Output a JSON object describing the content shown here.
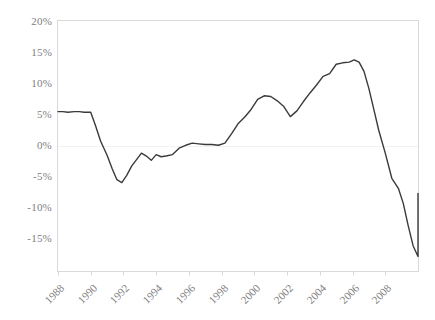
{
  "chart_data": {
    "type": "line",
    "title": "",
    "subtitle": "",
    "xlabel": "",
    "ylabel": "",
    "ylim": [
      -15,
      20
    ],
    "xlim": [
      1988,
      2010
    ],
    "grid": false,
    "legend": null,
    "y_ticks": [
      20,
      15,
      10,
      5,
      0,
      -5,
      -10,
      -15
    ],
    "y_tick_labels": [
      "20%",
      "15%",
      "10%",
      "5%",
      "0%",
      "-5%",
      "-10%",
      "-15%"
    ],
    "x_ticks": [
      1988,
      1990,
      1992,
      1994,
      1996,
      1998,
      2000,
      2002,
      2004,
      2006,
      2008
    ],
    "x_tick_labels": [
      "1988",
      "1990",
      "1992",
      "1994",
      "1996",
      "1998",
      "2000",
      "2002",
      "2004",
      "2006",
      "2008"
    ],
    "series": [
      {
        "name": "series-1",
        "color": "#3a3a3a",
        "line_width": 1.4,
        "x": [
          1988.0,
          1988.3,
          1988.6,
          1989.0,
          1989.3,
          1989.6,
          1990.0,
          1990.3,
          1990.6,
          1991.0,
          1991.3,
          1991.6,
          1991.9,
          1992.2,
          1992.5,
          1992.8,
          1993.1,
          1993.4,
          1993.7,
          1994.0,
          1994.3,
          1994.6,
          1995.0,
          1995.4,
          1995.8,
          1996.2,
          1996.6,
          1997.0,
          1997.4,
          1997.8,
          1998.2,
          1998.6,
          1999.0,
          1999.4,
          1999.8,
          2000.2,
          2000.6,
          2001.0,
          2001.4,
          2001.8,
          2002.2,
          2002.6,
          2003.0,
          2003.4,
          2003.8,
          2004.2,
          2004.6,
          2005.0,
          2005.4,
          2005.8,
          2006.1,
          2006.4,
          2006.7,
          2007.0,
          2007.3,
          2007.6,
          2008.0,
          2008.4,
          2008.8,
          2009.1,
          2009.4,
          2009.7,
          2010.0
        ],
        "values": [
          7.3,
          7.3,
          7.2,
          7.3,
          7.3,
          7.2,
          7.2,
          5.3,
          3.2,
          1.2,
          -0.6,
          -2.2,
          -2.6,
          -1.6,
          -0.3,
          0.6,
          1.5,
          1.1,
          0.5,
          1.3,
          1.0,
          1.1,
          1.3,
          2.2,
          2.6,
          2.9,
          2.8,
          2.7,
          2.7,
          2.6,
          2.9,
          4.2,
          5.6,
          6.5,
          7.6,
          9.0,
          9.5,
          9.4,
          8.8,
          8.0,
          6.6,
          7.4,
          8.7,
          9.9,
          11.0,
          12.2,
          12.6,
          13.9,
          14.1,
          14.2,
          14.5,
          14.2,
          12.9,
          10.5,
          7.6,
          4.7,
          1.5,
          -2.0,
          -3.4,
          -5.5,
          -8.6,
          -11.4,
          -12.9
        ],
        "end_value": -4.1
      }
    ],
    "annotations": []
  },
  "axes": {
    "frame_color": "#d9d9d9",
    "tick_color": "#d9d9d9",
    "label_color": "#808080",
    "background": "#ffffff"
  }
}
